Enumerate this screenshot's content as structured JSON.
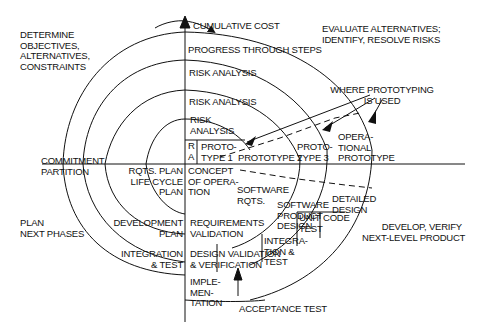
{
  "diagram": {
    "type": "spiral-model",
    "quadrants": {
      "top_left": "DETERMINE\nOBJECTIVES,\nALTERNATIVES,\nCONSTRAINTS",
      "top_right": "EVALUATE ALTERNATIVES;\nIDENTIFY, RESOLVE RISKS",
      "bottom_left": "PLAN\nNEXT PHASES",
      "bottom_right": "DEVELOP, VERIFY\nNEXT-LEVEL PRODUCT"
    },
    "axis": {
      "vertical_label": "CUMULATIVE COST",
      "progress_label": "PROGRESS THROUGH STEPS",
      "commitment_label": "COMMITMENT\nPARTITION"
    },
    "risk_analysis": [
      "RISK ANALYSIS",
      "RISK ANALYSIS",
      "RISK\nANALYSIS",
      "R\nA"
    ],
    "prototypes": [
      "PROTO-\nTYPE 1",
      "PROTOTYPE 2",
      "PROTO-\nTYPE 3",
      "OPERA-\nTIONAL\nPROTOTYPE"
    ],
    "prototyping_note": "WHERE PROTOTYPING\nIS USED",
    "plans": [
      "RQTS. PLAN\nLIFE CYCLE\nPLAN",
      "DEVELOPMENT\nPLAN",
      "INTEGRATION\n& TEST"
    ],
    "development": [
      "CONCEPT\nOF OPERA-\nTION",
      "SOFTWARE\nRQTS.",
      "SOFTWARE\nPRODUCT\nDESIGN",
      "DETAILED\nDESIGN",
      "CODE",
      "UNIT\nTEST",
      "INTEGRA-\nTION &\nTEST",
      "ACCEPTANCE TEST",
      "IMPLE-\nMEN-\nTATION"
    ],
    "validation": [
      "REQUIREMENTS\nVALIDATION",
      "DESIGN VALIDATION\n& VERIFICATION"
    ],
    "colors": {
      "ink": "#111111",
      "background": "#ffffff"
    }
  }
}
